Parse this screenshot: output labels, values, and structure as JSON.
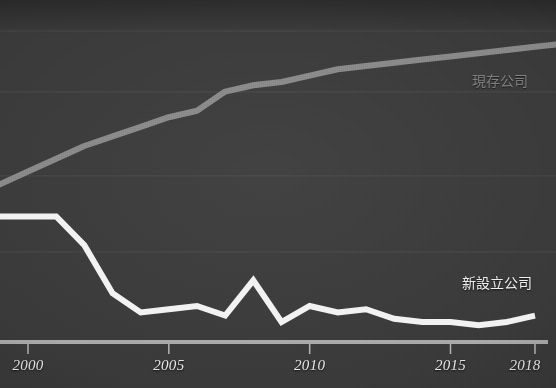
{
  "chart_data": {
    "type": "line",
    "title": "",
    "subtitle": "",
    "xlabel": "",
    "ylabel": "",
    "xlim": [
      2000,
      2018
    ],
    "ylim": [
      0,
      100
    ],
    "grid": true,
    "legend_position": "inline-right",
    "x": [
      2000,
      2001,
      2002,
      2003,
      2004,
      2005,
      2006,
      2007,
      2008,
      2009,
      2010,
      2011,
      2012,
      2013,
      2014,
      2015,
      2016,
      2017,
      2018
    ],
    "series": [
      {
        "name": "現存公司",
        "color": "#8c8c8c",
        "values": [
          52,
          56,
          60,
          63,
          66,
          69,
          71,
          77,
          79,
          80,
          82,
          84,
          85,
          86,
          87,
          88,
          89,
          90,
          91
        ]
      },
      {
        "name": "新設立公司",
        "color": "#f2f2f2",
        "values": [
          38,
          38,
          29,
          14,
          8,
          9,
          10,
          7,
          18,
          5,
          10,
          8,
          9,
          6,
          5,
          5,
          4,
          5,
          7
        ]
      }
    ],
    "x_ticks": [
      {
        "value": 2000,
        "label": "2000"
      },
      {
        "value": 2005,
        "label": "2005"
      },
      {
        "value": 2010,
        "label": "2010"
      },
      {
        "value": 2015,
        "label": "2015"
      },
      {
        "value": 2018,
        "label": "2018"
      }
    ],
    "y_gridlines": [
      30,
      50,
      70,
      85
    ],
    "annotations": [
      {
        "name": "legend-existing",
        "text": "現存公司"
      },
      {
        "name": "legend-new",
        "text": "新設立公司"
      }
    ]
  },
  "legend": {
    "existing": "現存公司",
    "new": "新設立公司"
  },
  "axis": {
    "ticks": [
      "2000",
      "2005",
      "2010",
      "2015",
      "2018"
    ]
  },
  "colors": {
    "background": "#3a3a3a",
    "existing_line": "#8c8c8c",
    "new_line": "#f2f2f2",
    "axis": "#b9b9b9",
    "gridline": "#4a4a4a",
    "tick_text": "#e8e8e8"
  }
}
